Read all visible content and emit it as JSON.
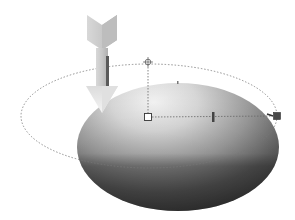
{
  "scene": {
    "width": 295,
    "height": 220,
    "background": "#ffffff",
    "ellipse_shape": {
      "cx": 178,
      "cy": 147,
      "rx": 101,
      "ry": 64,
      "colors": {
        "highlight": "#f2f2f2",
        "mid": "#a9a9a9",
        "shadow": "#4d4d4d",
        "edge": "#3a3a3a"
      }
    },
    "gradient_control": {
      "path_ellipse": {
        "cx": 149,
        "cy": 116,
        "rx": 128,
        "ry": 52,
        "stroke": "#777777"
      },
      "center_handle": {
        "x": 148,
        "y": 117,
        "size": 7
      },
      "top_handle": {
        "x": 148,
        "y": 62
      },
      "mid_slider": {
        "x": 213,
        "y": 117
      },
      "end_handle": {
        "x": 277,
        "y": 116,
        "size": 7,
        "fill": "#4a4a4a"
      }
    },
    "arrow": {
      "x_left": 86,
      "x_right": 118,
      "top": 15,
      "tip": 113,
      "colors": {
        "light": "#e6e6e6",
        "mid": "#c4c4c4",
        "dark": "#5a5a5a"
      }
    }
  }
}
